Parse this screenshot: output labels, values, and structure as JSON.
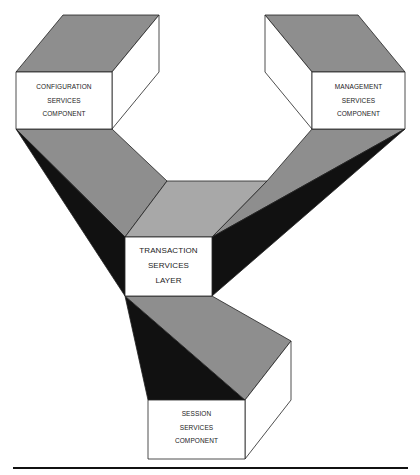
{
  "diagram": {
    "type": "3d-block-architecture",
    "colors": {
      "gray_face": "#8e8e8e",
      "light_gray_face": "#a8a8a8",
      "dark_face": "#111111",
      "white_face": "#ffffff",
      "outline": "#222222"
    },
    "nodes": [
      {
        "id": "configuration",
        "lines": [
          "CONFIGURATION",
          "SERVICES",
          "COMPONENT"
        ]
      },
      {
        "id": "management",
        "lines": [
          "MANAGEMENT",
          "SERVICES",
          "COMPONENT"
        ]
      },
      {
        "id": "transaction",
        "lines": [
          "TRANSACTION",
          "SERVICES",
          "LAYER"
        ]
      },
      {
        "id": "session",
        "lines": [
          "SESSION",
          "SERVICES",
          "COMPONENT"
        ]
      }
    ],
    "connections": [
      {
        "from": "configuration",
        "to": "transaction"
      },
      {
        "from": "management",
        "to": "transaction"
      },
      {
        "from": "transaction",
        "to": "session"
      }
    ]
  }
}
